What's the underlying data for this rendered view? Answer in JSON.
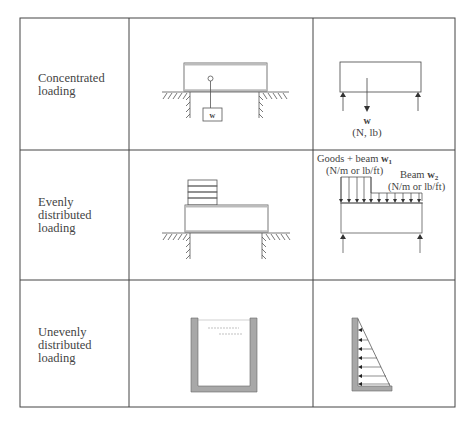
{
  "rows": [
    {
      "label_lines": [
        "Concentrated",
        "loading"
      ],
      "diagram": "beam-on-supports-with-hanging-weight",
      "fbd": {
        "load_symbol": "w",
        "units": "(N, lb)"
      },
      "weight_box_label": "w"
    },
    {
      "label_lines": [
        "Evenly",
        "distributed",
        "loading"
      ],
      "diagram": "beam-with-stacked-goods-on-supports",
      "fbd": {
        "load1_label": "Goods + beam",
        "load1_symbol": "w",
        "load1_sub": "1",
        "load1_units": "(N/m or lb/ft)",
        "load2_label": "Beam",
        "load2_symbol": "w",
        "load2_sub": "2",
        "load2_units": "(N/m or lb/ft)"
      }
    },
    {
      "label_lines": [
        "Unevenly",
        "distributed",
        "loading"
      ],
      "diagram": "tank-with-liquid",
      "fbd": "triangular-hydrostatic-pressure-on-wall"
    }
  ],
  "colors": {
    "line": "#333333",
    "wall_fill": "#a8a8a8",
    "beam_stripe": "#bdbdbd"
  }
}
